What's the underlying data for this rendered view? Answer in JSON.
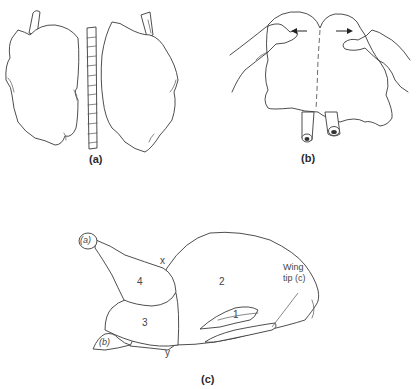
{
  "figure": {
    "panels": [
      {
        "id": "a",
        "label": "(a)",
        "description": "Carcass split into two halves with backbone strip removed"
      },
      {
        "id": "b",
        "label": "(b)",
        "description": "Hands pulling the two halves apart along the dashed midline"
      },
      {
        "id": "c",
        "label": "(c)",
        "description": "Side view of bird with numbered cut regions"
      }
    ],
    "panel_c": {
      "markers": {
        "a": "(a)",
        "b": "(b)",
        "x": "x",
        "y": "y"
      },
      "regions": [
        "1",
        "2",
        "3",
        "4"
      ],
      "callout_line1": "Wing",
      "callout_line2": "tip (c)"
    },
    "colors": {
      "ink": "#3a3a3a",
      "background": "#ffffff"
    }
  }
}
